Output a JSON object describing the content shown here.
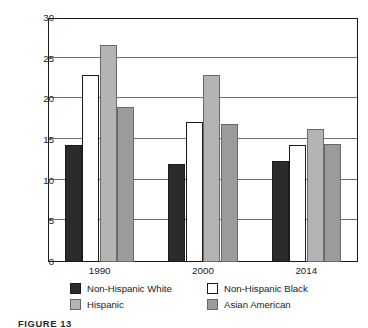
{
  "chart_data": {
    "type": "bar",
    "title": "",
    "xlabel": "",
    "ylabel": "BIRTH RATE PER 1,000 POPULATION",
    "ylim": [
      0,
      30
    ],
    "yticks": [
      0,
      5,
      10,
      15,
      20,
      25,
      30
    ],
    "ytick_labels": [
      "0",
      "5",
      "10",
      "15",
      "20",
      "25",
      "30"
    ],
    "grid": "horizontal",
    "legend_position": "below-axes",
    "categories": [
      "1990",
      "2000",
      "2014"
    ],
    "series": [
      {
        "name": "Non-Hispanic White",
        "color": "#2b2b2b",
        "values": [
          14.4,
          12.1,
          12.4
        ]
      },
      {
        "name": "Non-Hispanic Black",
        "color": "#ffffff",
        "values": [
          23.0,
          17.2,
          14.4
        ]
      },
      {
        "name": "Hispanic",
        "color": "#b4b4b4",
        "values": [
          26.7,
          23.0,
          16.4
        ]
      },
      {
        "name": "Asian American",
        "color": "#9b9b9b",
        "values": [
          19.0,
          17.0,
          14.5
        ]
      }
    ]
  },
  "caption": "FIGURE 13",
  "colors": {
    "axis": "#1c1c1c",
    "grid": "#6e6e6e",
    "text": "#1a1a1a",
    "background": "#ffffff"
  }
}
